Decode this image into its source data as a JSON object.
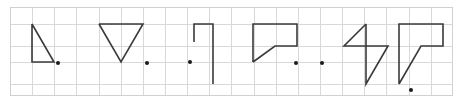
{
  "figure": {
    "background_color": "#ffffff",
    "width": 464,
    "height": 106
  },
  "grid": {
    "line_color": "#d8d8dc",
    "border_color": "#cfcfd4",
    "cell_size": 22,
    "origin_x": 10,
    "origin_y": 7,
    "columns": 20,
    "rows": 4,
    "x_lines": [
      10,
      32,
      54,
      76,
      99,
      121,
      143,
      165,
      187,
      209,
      231,
      254,
      276,
      298,
      320,
      342,
      364,
      386,
      409,
      431,
      452
    ],
    "y_lines": [
      7,
      24,
      46,
      62,
      84,
      95
    ]
  },
  "shapes": [
    {
      "id": "shape-1",
      "name": "right-triangle",
      "stroke": "#3a3a3a",
      "points": "32,24 32,62 54,62 32,24",
      "closed": true
    },
    {
      "id": "shape-2",
      "name": "down-triangle",
      "stroke": "#3a3a3a",
      "points": "99,24 143,24 121,62 99,24",
      "closed": true
    },
    {
      "id": "shape-3",
      "name": "flag-with-stem",
      "stroke": "#3a3a3a",
      "points": "194,42 194,24 213,24 213,42 213,84",
      "closed": false
    },
    {
      "id": "shape-4",
      "name": "speech-bubble-quad",
      "stroke": "#3a3a3a",
      "points": "253,62 253,24 297,24 297,46 275,46 253,62",
      "closed": true
    },
    {
      "id": "shape-5",
      "name": "zigzag-bowtie",
      "stroke": "#3a3a3a",
      "points": "366,24 344,46 388,46 366,84 366,24",
      "closed": true
    },
    {
      "id": "shape-6",
      "name": "tall-speech-bubble-quad",
      "stroke": "#3a3a3a",
      "points": "399,84 399,24 443,24 443,46 421,46 399,84",
      "closed": true
    }
  ],
  "dots": [
    {
      "id": "dot-1",
      "name": "marker-dot-right-of-triangle",
      "cx": 58,
      "cy": 63,
      "r": 2.0,
      "color": "#1a1a1a"
    },
    {
      "id": "dot-2",
      "name": "marker-dot-right-of-down-triangle",
      "cx": 147,
      "cy": 63,
      "r": 2.0,
      "color": "#1a1a1a"
    },
    {
      "id": "dot-3",
      "name": "marker-dot-left-of-flag",
      "cx": 190,
      "cy": 62,
      "r": 2.0,
      "color": "#1a1a1a"
    },
    {
      "id": "dot-4",
      "name": "marker-dot-right-of-bubble",
      "cx": 296,
      "cy": 63,
      "r": 2.0,
      "color": "#1a1a1a"
    },
    {
      "id": "dot-5",
      "name": "marker-dot-left-of-zigzag",
      "cx": 322,
      "cy": 63,
      "r": 2.0,
      "color": "#1a1a1a"
    },
    {
      "id": "dot-6",
      "name": "marker-dot-below-tall-bubble",
      "cx": 411,
      "cy": 90,
      "r": 2.0,
      "color": "#1a1a1a"
    }
  ]
}
